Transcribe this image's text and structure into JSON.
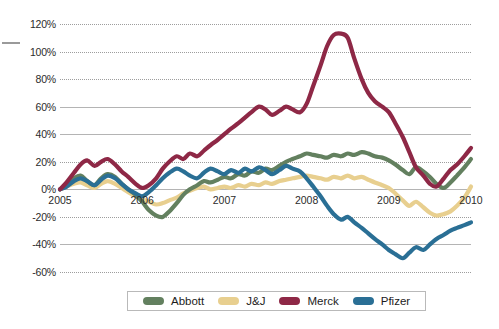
{
  "chart_data": {
    "type": "line",
    "title": "",
    "subtitle": "",
    "xlabel": "",
    "ylabel": "",
    "xlim": [
      2005.0,
      2010.0
    ],
    "ylim": [
      -60,
      120
    ],
    "grid": true,
    "legend_position": "bottom",
    "x_ticks": [
      "2005",
      "2006",
      "2007",
      "2008",
      "2009",
      "2010"
    ],
    "x_tick_values": [
      2005,
      2006,
      2007,
      2008,
      2009,
      2010
    ],
    "y_ticks": [
      "120%",
      "100%",
      "80%",
      "60%",
      "40%",
      "20%",
      "0%",
      "-20%",
      "-40%",
      "-60%"
    ],
    "y_tick_values": [
      120,
      100,
      80,
      60,
      40,
      20,
      0,
      -20,
      -40,
      -60
    ],
    "x": [
      2005.0,
      2005.08,
      2005.17,
      2005.25,
      2005.33,
      2005.42,
      2005.5,
      2005.58,
      2005.67,
      2005.75,
      2005.83,
      2005.92,
      2006.0,
      2006.08,
      2006.17,
      2006.25,
      2006.33,
      2006.42,
      2006.5,
      2006.58,
      2006.67,
      2006.75,
      2006.83,
      2006.92,
      2007.0,
      2007.08,
      2007.17,
      2007.25,
      2007.33,
      2007.42,
      2007.5,
      2007.58,
      2007.67,
      2007.75,
      2007.83,
      2007.92,
      2008.0,
      2008.08,
      2008.17,
      2008.25,
      2008.33,
      2008.42,
      2008.5,
      2008.58,
      2008.67,
      2008.75,
      2008.83,
      2008.92,
      2009.0,
      2009.08,
      2009.17,
      2009.25,
      2009.33,
      2009.42,
      2009.5,
      2009.58,
      2009.67,
      2009.75,
      2009.83,
      2009.92,
      2010.0
    ],
    "series": [
      {
        "name": "Abbott",
        "color": "#63805f",
        "values": [
          0,
          3,
          8,
          10,
          6,
          3,
          8,
          11,
          9,
          4,
          0,
          -4,
          -9,
          -15,
          -19,
          -20,
          -16,
          -10,
          -4,
          0,
          3,
          6,
          5,
          7,
          9,
          8,
          11,
          10,
          13,
          12,
          15,
          14,
          17,
          20,
          22,
          24,
          26,
          25,
          24,
          23,
          25,
          24,
          26,
          25,
          27,
          26,
          24,
          23,
          21,
          18,
          14,
          11,
          16,
          13,
          9,
          4,
          1,
          5,
          10,
          16,
          22
        ]
      },
      {
        "name": "J&J",
        "color": "#e8cf8f",
        "values": [
          0,
          2,
          4,
          5,
          3,
          1,
          4,
          6,
          4,
          1,
          -2,
          -5,
          -7,
          -9,
          -11,
          -10,
          -8,
          -6,
          -3,
          -1,
          1,
          2,
          0,
          1,
          2,
          1,
          3,
          2,
          4,
          3,
          5,
          4,
          6,
          7,
          8,
          9,
          10,
          9,
          8,
          7,
          9,
          8,
          10,
          8,
          9,
          7,
          5,
          3,
          1,
          -3,
          -8,
          -12,
          -9,
          -13,
          -17,
          -19,
          -18,
          -16,
          -12,
          -6,
          2
        ]
      },
      {
        "name": "Merck",
        "color": "#8e2846",
        "values": [
          0,
          5,
          12,
          18,
          21,
          17,
          20,
          22,
          18,
          13,
          9,
          4,
          1,
          3,
          8,
          15,
          20,
          24,
          22,
          26,
          24,
          28,
          32,
          36,
          40,
          44,
          48,
          52,
          56,
          60,
          58,
          54,
          57,
          60,
          58,
          56,
          62,
          75,
          90,
          104,
          112,
          113,
          110,
          95,
          80,
          70,
          64,
          60,
          56,
          48,
          38,
          27,
          16,
          10,
          4,
          2,
          8,
          14,
          18,
          24,
          30
        ]
      },
      {
        "name": "Pfizer",
        "color": "#2a6f95",
        "values": [
          0,
          2,
          6,
          8,
          6,
          3,
          7,
          10,
          8,
          4,
          0,
          -3,
          -5,
          -2,
          3,
          8,
          12,
          15,
          13,
          10,
          8,
          12,
          15,
          13,
          11,
          14,
          12,
          15,
          13,
          16,
          14,
          11,
          14,
          17,
          15,
          13,
          8,
          2,
          -5,
          -12,
          -18,
          -22,
          -20,
          -24,
          -28,
          -32,
          -36,
          -40,
          -44,
          -47,
          -50,
          -46,
          -42,
          -44,
          -40,
          -36,
          -33,
          -30,
          -28,
          -26,
          -24
        ]
      }
    ],
    "legend": [
      {
        "label": "Abbott",
        "color": "#63805f"
      },
      {
        "label": "J&J",
        "color": "#e8cf8f"
      },
      {
        "label": "Merck",
        "color": "#8e2846"
      },
      {
        "label": "Pfizer",
        "color": "#2a6f95"
      }
    ]
  }
}
